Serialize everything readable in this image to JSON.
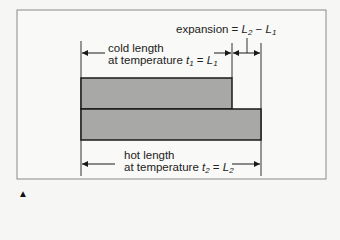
{
  "diagram": {
    "expansion": {
      "label": "expansion =",
      "formula_a": "L",
      "formula_a_sub": "2",
      "minus": "−",
      "formula_b": "L",
      "formula_b_sub": "1"
    },
    "cold": {
      "line1": "cold length",
      "line2_prefix": "at temperature",
      "temp_var": "t",
      "temp_sub": "1",
      "equals": "=",
      "len_var": "L",
      "len_sub": "1"
    },
    "hot": {
      "line1": "hot length",
      "line2_prefix": "at temperature",
      "temp_var": "t",
      "temp_sub": "2",
      "equals": "=",
      "len_var": "L",
      "len_sub": "2"
    },
    "colors": {
      "bar_fill": "#a8a8a6",
      "outline": "#1a1a1a",
      "frame": "#8a8a8a",
      "background": "#f6f6f4"
    },
    "pointer_marker": "▲"
  }
}
